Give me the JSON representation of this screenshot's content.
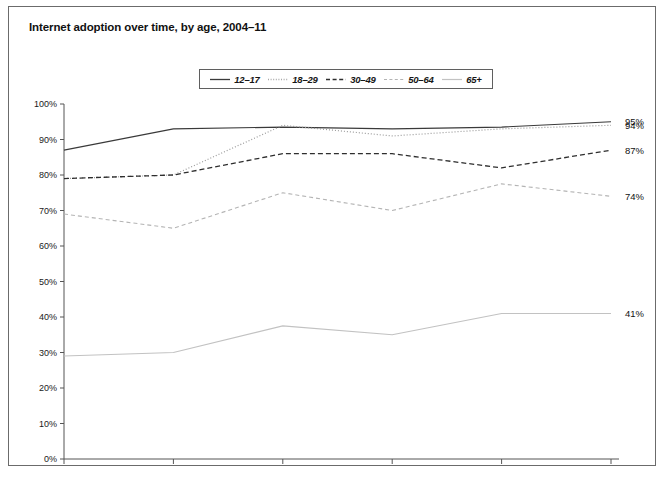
{
  "chart": {
    "title": "Internet adoption over time, by age, 2004–11",
    "frame_border_color": "#6b6b6b",
    "background": "#ffffff"
  },
  "legend": {
    "position": "top-center",
    "items": [
      {
        "label": "12–17",
        "style": "solid",
        "color": "#3a3a3a",
        "width": 1.2,
        "dash": "none"
      },
      {
        "label": "18–29",
        "style": "dotted",
        "color": "#9a9a9a",
        "width": 1.2,
        "dash": "1,2"
      },
      {
        "label": "30–49",
        "style": "dashed",
        "color": "#2e2e2e",
        "width": 1.3,
        "dash": "5,3"
      },
      {
        "label": "50–64",
        "style": "fine-dashed",
        "color": "#b4b4b4",
        "width": 1.1,
        "dash": "4,3"
      },
      {
        "label": "65+",
        "style": "solid",
        "color": "#c2c2c2",
        "width": 1.1,
        "dash": "none"
      }
    ]
  },
  "chart_data": {
    "type": "line",
    "title": "Internet adoption over time, by age, 2004–11",
    "xlabel": "",
    "ylabel": "",
    "grid": false,
    "legend_position": "top-center",
    "categories": [
      "Nov 04",
      "Nov 06",
      "Nov-07",
      "Feb-08",
      "Sep-09",
      "July-11"
    ],
    "x_tick_labels": [
      "Nov 04",
      "Nov 06",
      "Nov-07",
      "Feb-08",
      "Sep-09",
      "July-11"
    ],
    "y_tick_labels": [
      "0%",
      "10%",
      "20%",
      "30%",
      "40%",
      "50%",
      "60%",
      "70%",
      "80%",
      "90%",
      "100%"
    ],
    "y_ticks": [
      0,
      10,
      20,
      30,
      40,
      50,
      60,
      70,
      80,
      90,
      100
    ],
    "ylim": [
      0,
      100
    ],
    "y_unit": "%",
    "series": [
      {
        "name": "12–17",
        "values": [
          87,
          93,
          93.5,
          93,
          93.5,
          95
        ],
        "end_label": "95%"
      },
      {
        "name": "18–29",
        "values": [
          79,
          80,
          94,
          91,
          93,
          94
        ],
        "end_label": "94%"
      },
      {
        "name": "30–49",
        "values": [
          79,
          80,
          86,
          86,
          82,
          87
        ],
        "end_label": "87%"
      },
      {
        "name": "50–64",
        "values": [
          69,
          65,
          75,
          70,
          77.5,
          74
        ],
        "end_label": "74%"
      },
      {
        "name": "65+",
        "values": [
          29,
          30,
          37.5,
          35,
          41,
          41
        ],
        "end_label": "41%"
      }
    ],
    "end_labels": [
      "95%",
      "94%",
      "87%",
      "74%",
      "41%"
    ]
  }
}
